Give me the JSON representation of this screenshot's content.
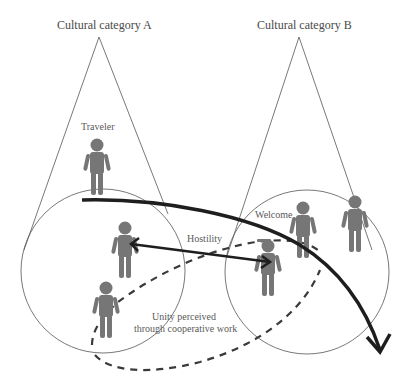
{
  "diagram": {
    "categories": [
      {
        "id": "A",
        "label": "Cultural category A"
      },
      {
        "id": "B",
        "label": "Cultural category B"
      }
    ],
    "labels": {
      "traveler": "Traveler",
      "welcome": "Welcome",
      "hostility": "Hostility",
      "unity_line1": "Unity perceived",
      "unity_line2": "through cooperative work"
    },
    "colors": {
      "figure": "#767676",
      "outline": "#555555",
      "arrow": "#1e1e1e",
      "dashed": "#3a3a3a",
      "text": "#555555"
    },
    "figures": [
      {
        "name": "traveler",
        "group": "A"
      },
      {
        "name": "person-a1",
        "group": "A"
      },
      {
        "name": "person-a2",
        "group": "A"
      },
      {
        "name": "person-b-hostile",
        "group": "B"
      },
      {
        "name": "person-b-welcome-1",
        "group": "B"
      },
      {
        "name": "person-b-welcome-2",
        "group": "B"
      }
    ],
    "connectors": [
      {
        "type": "curved-arrow",
        "from": "traveler",
        "to": "category B outer",
        "style": "thick-solid"
      },
      {
        "type": "double-arrow",
        "from": "person-a1",
        "to": "person-b-hostile",
        "label": "Hostility"
      },
      {
        "type": "dashed-loop",
        "label": "Unity perceived through cooperative work"
      }
    ]
  }
}
